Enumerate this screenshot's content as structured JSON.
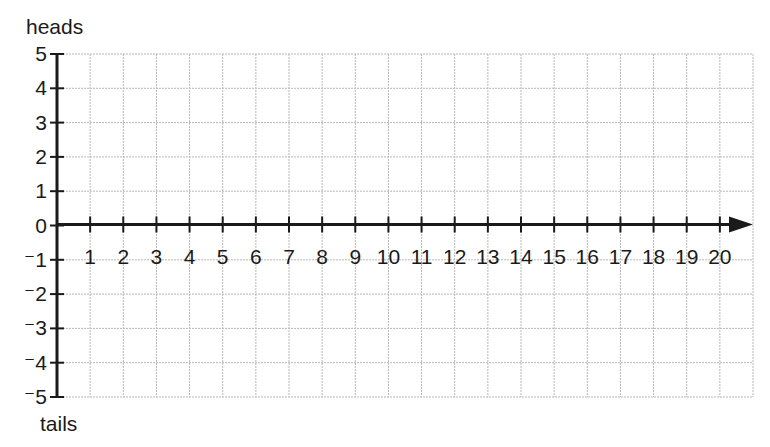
{
  "chart_data": {
    "type": "line",
    "title": "",
    "xlabel": "",
    "ylabel_top": "heads",
    "ylabel_bottom": "tails",
    "x": [
      1,
      2,
      3,
      4,
      5,
      6,
      7,
      8,
      9,
      10,
      11,
      12,
      13,
      14,
      15,
      16,
      17,
      18,
      19,
      20
    ],
    "x_tick_labels": [
      "1",
      "2",
      "3",
      "4",
      "5",
      "6",
      "7",
      "8",
      "9",
      "10",
      "11",
      "12",
      "13",
      "14",
      "15",
      "16",
      "17",
      "18",
      "19",
      "20"
    ],
    "y_tick_values": [
      5,
      4,
      3,
      2,
      1,
      0,
      -1,
      -2,
      -3,
      -4,
      -5
    ],
    "y_tick_labels": [
      "5",
      "4",
      "3",
      "2",
      "1",
      "0",
      "⁻1",
      "⁻2",
      "⁻3",
      "⁻4",
      "⁻5"
    ],
    "series": [],
    "xlim": [
      0,
      21
    ],
    "ylim": [
      -5,
      5
    ],
    "grid": true,
    "legend": null,
    "annotations": [
      "x-axis drawn as arrow pointing right at y = 0"
    ]
  },
  "colors": {
    "axis": "#1a1a1a",
    "grid": "#b8b8b8",
    "background": "#ffffff"
  }
}
